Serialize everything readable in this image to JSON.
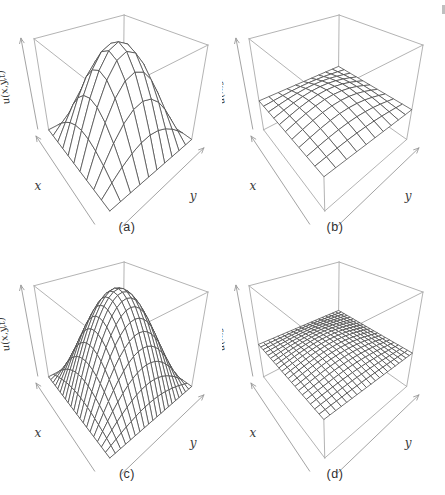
{
  "figure": {
    "panel_ids": [
      "a",
      "b",
      "c",
      "d"
    ]
  },
  "colors": {
    "background": "#ffffff",
    "mesh_line": "#474747",
    "surface_fill": "#ffffff",
    "box_line": "#aaaaaa",
    "axis_line": "#999999",
    "axis_label": "#3a3a3a",
    "caption_text": "#2e2e2e",
    "page_edge_artifact": "#bfbfbf"
  },
  "chart_data": [
    {
      "id": "a",
      "type": "surface",
      "caption": "(a)",
      "xlabel": "x",
      "ylabel": "y",
      "zlabel": "u(x,y,t)",
      "x_range": [
        0,
        1
      ],
      "y_range": [
        0,
        1
      ],
      "z_range": [
        0,
        1
      ],
      "mesh": {
        "nx": 10,
        "ny": 10
      },
      "surface": {
        "formula": "u = base + amplitude*sin(pi*x)*sin(pi*y)",
        "base": 0,
        "amplitude": 1,
        "peak": 1
      },
      "view": {
        "theta_deg": 40,
        "phi_deg": 30,
        "z_scale": 0.78,
        "camera_distance": 2.0
      }
    },
    {
      "id": "b",
      "type": "surface",
      "caption": "(b)",
      "xlabel": "x",
      "ylabel": "y",
      "zlabel": "u(x,y,t)",
      "x_range": [
        0,
        1
      ],
      "y_range": [
        0,
        1
      ],
      "z_range": [
        0,
        1
      ],
      "mesh": {
        "nx": 10,
        "ny": 10
      },
      "surface": {
        "formula": "u = base + amplitude*sin(pi*x)*sin(pi*y)",
        "base": 0.36,
        "amplitude": 0.12,
        "peak": 0.48
      },
      "view": {
        "theta_deg": 40,
        "phi_deg": 30,
        "z_scale": 0.78,
        "camera_distance": 2.0
      }
    },
    {
      "id": "c",
      "type": "surface",
      "caption": "(c)",
      "xlabel": "x",
      "ylabel": "y",
      "zlabel": "u(x,y,t)",
      "x_range": [
        0,
        1
      ],
      "y_range": [
        0,
        1
      ],
      "z_range": [
        0,
        1
      ],
      "mesh": {
        "nx": 20,
        "ny": 20
      },
      "surface": {
        "formula": "u = base + amplitude*sin(pi*x)*sin(pi*y)",
        "base": 0,
        "amplitude": 1,
        "peak": 1
      },
      "view": {
        "theta_deg": 40,
        "phi_deg": 30,
        "z_scale": 0.78,
        "camera_distance": 2.0
      }
    },
    {
      "id": "d",
      "type": "surface",
      "caption": "(d)",
      "xlabel": "x",
      "ylabel": "y",
      "zlabel": "u(x,y,t)",
      "x_range": [
        0,
        1
      ],
      "y_range": [
        0,
        1
      ],
      "z_range": [
        0,
        1
      ],
      "mesh": {
        "nx": 20,
        "ny": 20
      },
      "surface": {
        "formula": "u = base + amplitude*sin(pi*x)*sin(pi*y)",
        "base": 0.4,
        "amplitude": 0.08,
        "peak": 0.48
      },
      "view": {
        "theta_deg": 40,
        "phi_deg": 30,
        "z_scale": 0.78,
        "camera_distance": 2.0
      }
    }
  ]
}
